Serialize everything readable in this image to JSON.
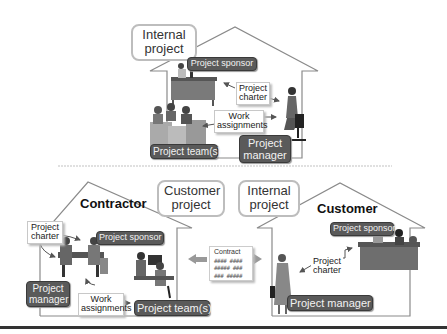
{
  "top_house": {
    "callout": "Internal project",
    "sponsor_label": "Project sponsor",
    "charter_note": "Project charter",
    "work_note": "Work assignments",
    "team_label": "Project team(s)",
    "manager_label": "Project manager"
  },
  "left_house": {
    "title": "Contractor",
    "callout": "Customer project",
    "charter_note": "Project charter",
    "sponsor_label": "Project sponsor",
    "manager_label": "Project manager",
    "work_note": "Work assignments",
    "team_label": "Project team(s)"
  },
  "contract": {
    "title": "Contract",
    "lines": [
      "#### ####",
      "##### ###",
      "### #####"
    ]
  },
  "right_house": {
    "title": "Customer",
    "callout": "Internal project",
    "sponsor_label": "Project sponsor",
    "charter_note": "Project charter",
    "manager_label": "Project manager"
  },
  "colors": {
    "tag_fill": "#5a5a5a",
    "tag_text": "#f2f2f2",
    "outline": "#8a8a8a",
    "arrow": "#888888"
  }
}
